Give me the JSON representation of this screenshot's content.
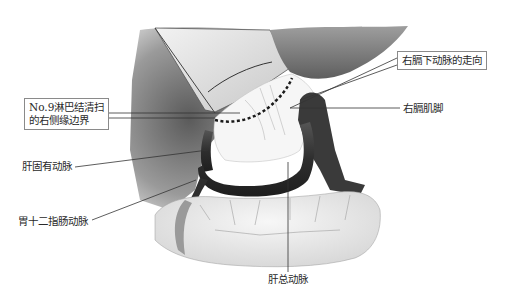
{
  "figure": {
    "type": "surgical anatomy illustration",
    "labels": {
      "right_inferior_phrenic_artery_course": "右膈下动脉的走向",
      "no9_lymph_node_boundary_line1": "No.9淋巴结清扫",
      "no9_lymph_node_boundary_line2": "的右侧缘边界",
      "right_crus_of_diaphragm": "右膈肌脚",
      "proper_hepatic_artery": "肝固有动脉",
      "gastroduodenal_artery": "胃十二指肠动脉",
      "common_hepatic_artery": "肝总动脉"
    },
    "colors": {
      "background": "#ffffff",
      "artery": "#3a3a3a",
      "tissue_dark": "#6e6e6e",
      "tissue_light": "#d9d9d9",
      "pancreas": "#ececec",
      "line": "#333333",
      "box_border": "#8a8a8a"
    }
  }
}
